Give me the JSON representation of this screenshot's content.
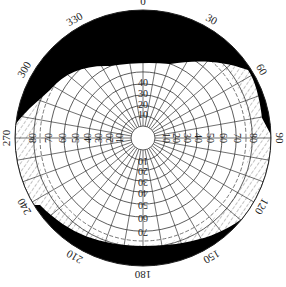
{
  "chart_data": {
    "type": "polar",
    "title": "",
    "center": [
      143,
      138
    ],
    "outer_radius": 128,
    "inner_circle_radius": 12,
    "azimuth_labels": [
      "0",
      "30",
      "60",
      "90",
      "120",
      "150",
      "180",
      "210",
      "240",
      "270",
      "300",
      "330"
    ],
    "azimuth_angles": [
      0,
      30,
      60,
      90,
      120,
      150,
      180,
      210,
      240,
      270,
      300,
      330
    ],
    "ring_values": [
      10,
      20,
      30,
      40,
      50,
      60,
      70,
      80,
      90
    ],
    "ring_labels_north": [
      "10",
      "20",
      "30",
      "40"
    ],
    "ring_labels_east": [
      "10",
      "20",
      "30",
      "40",
      "50",
      "60",
      "70",
      "80"
    ],
    "ring_labels_west": [
      "10",
      "20",
      "30",
      "40",
      "50",
      "60",
      "70",
      "80"
    ],
    "ring_labels_south": [
      "10",
      "20",
      "30",
      "40",
      "50",
      "60",
      "70"
    ],
    "radial_line_step_deg": 10,
    "obstruction_top": {
      "description": "Black mask covering the northern sky roughly from azimuth 280 to 80, extending inward to about ring 55 near north",
      "fill": "#000000"
    },
    "obstruction_bottom": {
      "description": "Thin black band along the southern horizon from about azimuth 125 to 235",
      "fill": "#000000"
    },
    "hatched_zone": {
      "description": "Diagonal hatched band between roughly ring 60 and the mask boundary on the east, west and south sides",
      "stroke": "#555555"
    },
    "dashed_ring": {
      "value": 62,
      "style": "dashed"
    }
  }
}
